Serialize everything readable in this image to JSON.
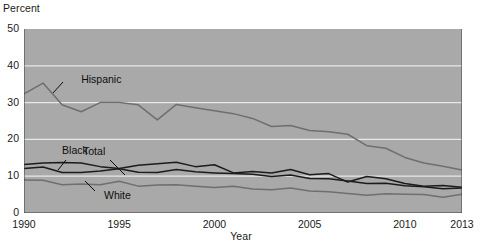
{
  "chart_data": {
    "type": "line",
    "title": "",
    "xlabel": "Year",
    "ylabel": "Percent",
    "ylim": [
      0,
      50
    ],
    "xlim": [
      1990,
      2013
    ],
    "ytick_values": [
      0,
      10,
      20,
      30,
      40,
      50
    ],
    "ytick_labels": [
      "0",
      "10",
      "20",
      "30",
      "40",
      "50"
    ],
    "xtick_values": [
      1990,
      1995,
      2000,
      2005,
      2010,
      2013
    ],
    "xtick_labels": [
      "1990",
      "1995",
      "2000",
      "2005",
      "2010",
      "2013"
    ],
    "grid": "horizontal-white",
    "legend": "inline-callout-labels",
    "plot_background": "#a9a9a9",
    "x": [
      1990,
      1991,
      1992,
      1993,
      1994,
      1995,
      1996,
      1997,
      1998,
      1999,
      2000,
      2001,
      2002,
      2003,
      2004,
      2005,
      2006,
      2007,
      2008,
      2009,
      2010,
      2011,
      2012,
      2013
    ],
    "series": [
      {
        "name": "Total",
        "color": "#1c1c1c",
        "label_x": 1993.1,
        "label_y": 16.6,
        "values": [
          12.1,
          12.5,
          11.0,
          11.0,
          11.4,
          12.0,
          11.1,
          11.0,
          11.8,
          11.2,
          10.9,
          10.7,
          10.5,
          9.9,
          10.3,
          9.4,
          9.3,
          8.7,
          8.0,
          8.1,
          7.4,
          7.1,
          6.6,
          6.8
        ]
      },
      {
        "name": "Black",
        "color": "#1c1c1c",
        "label_x": 1992.0,
        "label_y": 16.9,
        "values": [
          13.2,
          13.6,
          13.7,
          13.6,
          12.6,
          12.1,
          13.0,
          13.4,
          13.8,
          12.6,
          13.1,
          10.9,
          11.3,
          10.9,
          11.8,
          10.4,
          10.7,
          8.4,
          9.9,
          9.3,
          8.0,
          7.3,
          7.5,
          7.0
        ]
      },
      {
        "name": "White",
        "color": "#6f6f6f",
        "label_x": 1994.2,
        "label_y": 4.6,
        "values": [
          9.0,
          8.9,
          7.7,
          7.9,
          7.7,
          8.6,
          7.3,
          7.6,
          7.7,
          7.3,
          6.9,
          7.3,
          6.5,
          6.3,
          6.8,
          6.0,
          5.8,
          5.3,
          4.8,
          5.2,
          5.1,
          5.0,
          4.3,
          5.1
        ]
      },
      {
        "name": "Hispanic",
        "color": "#6f6f6f",
        "label_x": 1993.0,
        "label_y": 36.2,
        "values": [
          32.4,
          35.3,
          29.4,
          27.5,
          30.0,
          30.0,
          29.4,
          25.3,
          29.5,
          28.6,
          27.8,
          27.0,
          25.7,
          23.5,
          23.8,
          22.4,
          22.1,
          21.4,
          18.3,
          17.6,
          15.1,
          13.6,
          12.7,
          11.7
        ]
      }
    ],
    "callout_leaders": [
      {
        "series": "Hispanic",
        "from_x": 63,
        "from_y": 82,
        "to_x": 53,
        "to_y": 93
      },
      {
        "series": "Black",
        "from_x": 66,
        "from_y": 160,
        "to_x": 58,
        "to_y": 170
      },
      {
        "series": "Total",
        "from_x": 110,
        "from_y": 160,
        "to_x": 125,
        "to_y": 175
      },
      {
        "series": "White",
        "from_x": 95,
        "from_y": 191,
        "to_x": 85,
        "to_y": 181
      }
    ]
  }
}
